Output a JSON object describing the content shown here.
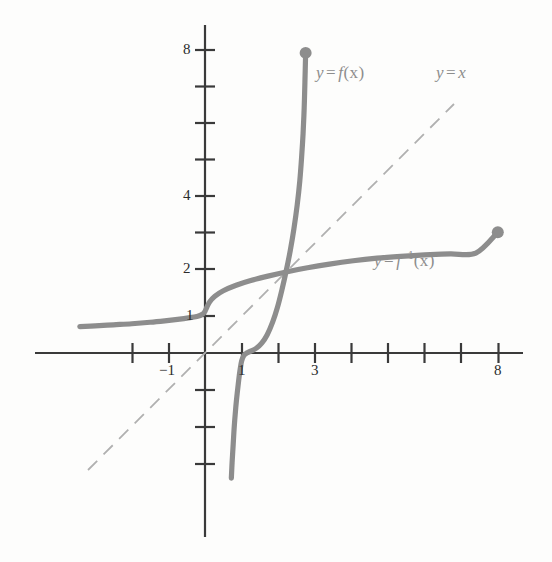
{
  "figure": {
    "title": "",
    "background_color": "#fdfdfc",
    "curve_color": "#8d8d8d",
    "axis_color": "#3a3a3a",
    "dashed_color": "#b0b0b0",
    "label_color": "#8d8d8d",
    "tick_text_color": "#2b2b2b"
  },
  "axes": {
    "x_tick_labels": [
      {
        "text": "−1",
        "value": -1
      },
      {
        "text": "1",
        "value": 1
      },
      {
        "text": "3",
        "value": 3
      },
      {
        "text": "8",
        "value": 8
      }
    ],
    "y_tick_labels": [
      {
        "text": "1",
        "value": 1
      },
      {
        "text": "2",
        "value": 2
      },
      {
        "text": "4",
        "value": 4
      },
      {
        "text": "8",
        "value": 8
      }
    ],
    "x_ticks_all": [
      -2,
      -1,
      1,
      2,
      3,
      4,
      5,
      6,
      7,
      8
    ],
    "y_ticks_all": [
      -3,
      -2,
      -1,
      1,
      2,
      3,
      4,
      5,
      6,
      7,
      8
    ],
    "xlim": [
      -4.7,
      9.5
    ],
    "ylim": [
      -5.0,
      8.6
    ]
  },
  "labels": {
    "f": {
      "y": "y",
      "eq": "=",
      "fn": "f",
      "arg": "(x)",
      "text": "y = f(x)"
    },
    "identity": {
      "y": "y",
      "eq": "=",
      "fn": "x",
      "text": "y = x"
    },
    "f_inverse": {
      "y": "y",
      "eq": "=",
      "fn": "f",
      "exp": "−1",
      "arg": "(x)",
      "text": "y = f⁻¹(x)"
    }
  },
  "chart_data": {
    "type": "line",
    "title": "",
    "xlabel": "",
    "ylabel": "",
    "xlim": [
      -4.7,
      9.5
    ],
    "ylim": [
      -5.0,
      8.6
    ],
    "grid": false,
    "legend": "inline-annotations",
    "series": [
      {
        "name": "y = f(x)",
        "color": "#8d8d8d",
        "style": "solid",
        "endpoint_dot": {
          "x": 2.75,
          "y": 8.2
        },
        "points": [
          [
            0.72,
            -3.42
          ],
          [
            0.74,
            -3.0
          ],
          [
            0.77,
            -2.5
          ],
          [
            0.8,
            -2.0
          ],
          [
            0.84,
            -1.5
          ],
          [
            0.88,
            -1.1
          ],
          [
            0.92,
            -0.75
          ],
          [
            0.96,
            -0.45
          ],
          [
            1.0,
            -0.22
          ],
          [
            1.06,
            -0.07
          ],
          [
            1.14,
            0.0
          ],
          [
            1.25,
            0.05
          ],
          [
            1.4,
            0.13
          ],
          [
            1.55,
            0.27
          ],
          [
            1.7,
            0.5
          ],
          [
            1.85,
            0.85
          ],
          [
            1.98,
            1.25
          ],
          [
            2.1,
            1.72
          ],
          [
            2.22,
            2.25
          ],
          [
            2.33,
            2.8
          ],
          [
            2.43,
            3.4
          ],
          [
            2.52,
            4.05
          ],
          [
            2.59,
            4.7
          ],
          [
            2.64,
            5.35
          ],
          [
            2.68,
            6.0
          ],
          [
            2.71,
            6.7
          ],
          [
            2.73,
            7.4
          ],
          [
            2.75,
            8.2
          ]
        ]
      },
      {
        "name": "y = f⁻¹(x)",
        "color": "#8d8d8d",
        "style": "solid",
        "endpoint_dot": {
          "x": 8.0,
          "y": 3.3
        },
        "points": [
          [
            -3.42,
            0.72
          ],
          [
            -3.0,
            0.74
          ],
          [
            -2.5,
            0.77
          ],
          [
            -2.0,
            0.8
          ],
          [
            -1.5,
            0.84
          ],
          [
            -1.1,
            0.88
          ],
          [
            -0.75,
            0.92
          ],
          [
            -0.45,
            0.96
          ],
          [
            -0.22,
            1.0
          ],
          [
            -0.07,
            1.06
          ],
          [
            0.0,
            1.14
          ],
          [
            0.05,
            1.25
          ],
          [
            0.13,
            1.4
          ],
          [
            0.27,
            1.55
          ],
          [
            0.5,
            1.7
          ],
          [
            0.85,
            1.85
          ],
          [
            1.25,
            1.98
          ],
          [
            1.72,
            2.1
          ],
          [
            2.25,
            2.22
          ],
          [
            2.8,
            2.33
          ],
          [
            3.4,
            2.43
          ],
          [
            4.05,
            2.52
          ],
          [
            4.7,
            2.59
          ],
          [
            5.35,
            2.64
          ],
          [
            6.0,
            2.68
          ],
          [
            6.7,
            2.71
          ],
          [
            7.4,
            2.73
          ],
          [
            8.0,
            3.3
          ]
        ]
      },
      {
        "name": "y = x",
        "color": "#b0b0b0",
        "style": "dashed",
        "points": [
          [
            -3.2,
            -3.2
          ],
          [
            6.8,
            6.8
          ]
        ]
      }
    ]
  }
}
